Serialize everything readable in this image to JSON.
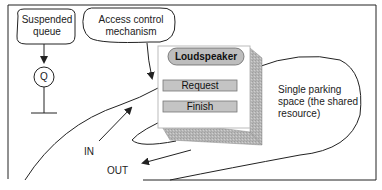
{
  "diagram": {
    "callouts": {
      "suspended_queue": [
        "Suspended",
        "queue"
      ],
      "access_control": [
        "Access control",
        "mechanism"
      ]
    },
    "queue_symbol": "Q",
    "panel": {
      "loudspeaker": "Loudspeaker",
      "request": "Request",
      "finish": "Finish"
    },
    "resource_label": [
      "Single parking",
      "space (the shared",
      "resource)"
    ],
    "flow_labels": {
      "in": "IN",
      "out": "OUT"
    },
    "colors": {
      "line": "#222222",
      "panel_face": "#ffffff",
      "panel_side": "#b8b8b8",
      "button_fill": "#c4c4c4",
      "loudspeaker_fill": "#bdbdbd"
    }
  }
}
